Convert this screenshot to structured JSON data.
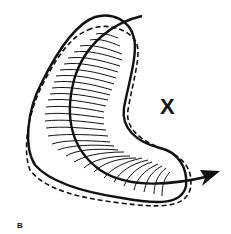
{
  "figure": {
    "panel_label": "B",
    "marker_label": "X",
    "colors": {
      "stroke": "#111111",
      "background": "#ffffff"
    },
    "elements": [
      {
        "name": "solid-outline",
        "style": "solid"
      },
      {
        "name": "dashed-outline",
        "style": "dashed"
      },
      {
        "name": "hatching",
        "style": "thin wavy lines across band"
      },
      {
        "name": "flow-arrow",
        "style": "solid curved arrow with arrowhead pointing right"
      }
    ]
  }
}
